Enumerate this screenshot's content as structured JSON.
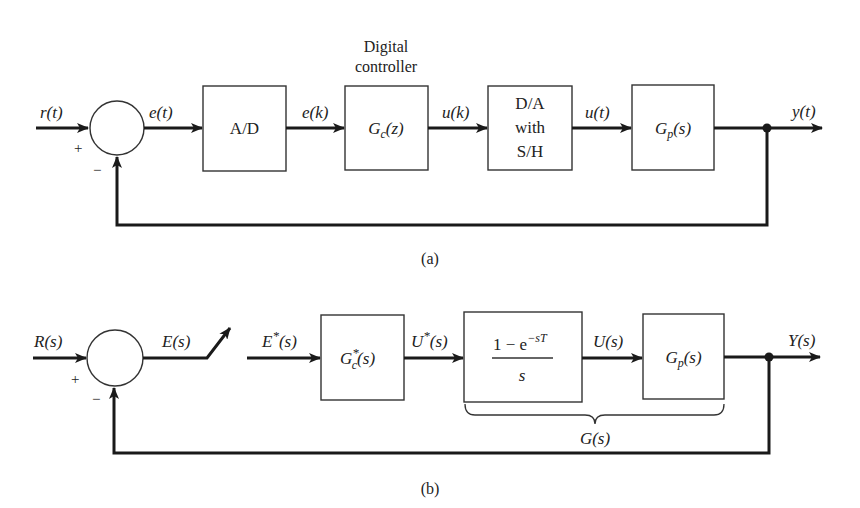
{
  "figure": {
    "a": {
      "caption": "(a)",
      "input_signal": "r(t)",
      "error_signal": "e(t)",
      "sampled_error": "e(k)",
      "controller_output": "u(k)",
      "hold_output": "u(t)",
      "output_signal": "y(t)",
      "sum_plus": "+",
      "sum_minus": "−",
      "blocks": {
        "ad": "A/D",
        "controller_heading_line1": "Digital",
        "controller_heading_line2": "controller",
        "controller": {
          "main": "G",
          "sub": "c",
          "arg": "(z)"
        },
        "da_line1": "D/A",
        "da_line2": "with",
        "da_line3": "S/H",
        "plant": {
          "main": "G",
          "sub": "p",
          "arg": "(s)"
        }
      }
    },
    "b": {
      "caption": "(b)",
      "input_signal": "R(s)",
      "error_signal": "E(s)",
      "sampled_error": {
        "main": "E",
        "sup": "*",
        "arg": "(s)"
      },
      "controller_output": {
        "main": "U",
        "sup": "*",
        "arg": "(s)"
      },
      "hold_output": "U(s)",
      "output_signal": "Y(s)",
      "sum_plus": "+",
      "sum_minus": "−",
      "blocks": {
        "controller": {
          "main": "G",
          "sup": "*",
          "sub": "c",
          "arg": "(s)"
        },
        "zoh_numerator": {
          "text": "1 − e",
          "sup": "−sT"
        },
        "zoh_denominator": "s",
        "plant": {
          "main": "G",
          "sub": "p",
          "arg": "(s)"
        }
      },
      "brace_label": "G(s)"
    }
  }
}
